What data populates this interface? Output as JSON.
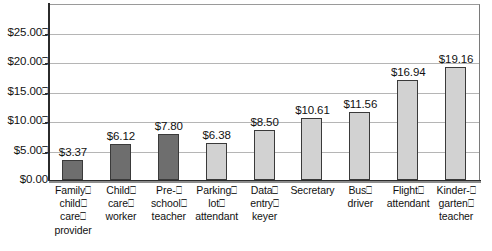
{
  "chart_data": {
    "type": "bar",
    "title": "",
    "subtitle": "",
    "xlabel": "",
    "ylabel": "",
    "ylim": [
      0,
      25
    ],
    "ytick_step": 5,
    "grid": true,
    "legend": "none",
    "value_prefix": "$",
    "categories": [
      "Family child care provider",
      "Child care worker",
      "Pre-school teacher",
      "Parking lot attendant",
      "Data entry keyer",
      "Secretary",
      "Bus driver",
      "Flight attendant",
      "Kindergarten teacher"
    ],
    "values": [
      3.37,
      6.12,
      7.8,
      6.38,
      8.5,
      10.61,
      11.56,
      16.94,
      19.16
    ],
    "value_labels": [
      "$3.37",
      "$6.12",
      "$7.80",
      "$6.38",
      "$8.50",
      "$10.61",
      "$11.56",
      "$16.94",
      "$19.16"
    ],
    "bar_colors": [
      "#6e6e6e",
      "#6e6e6e",
      "#6e6e6e",
      "#d2d2d2",
      "#d2d2d2",
      "#d2d2d2",
      "#d2d2d2",
      "#d2d2d2",
      "#d2d2d2"
    ],
    "series": [
      {
        "name": "Median hourly wage",
        "values": [
          3.37,
          6.12,
          7.8,
          6.38,
          8.5,
          10.61,
          11.56,
          16.94,
          19.16
        ]
      }
    ],
    "yticks": [
      {
        "value": 25,
        "label": "$25.00",
        "trailing_glyph": "⎕"
      },
      {
        "value": 20,
        "label": "$20.00",
        "trailing_glyph": "⎕"
      },
      {
        "value": 15,
        "label": "$15.00",
        "trailing_glyph": "⎕"
      },
      {
        "value": 10,
        "label": "$10.00",
        "trailing_glyph": "⎕"
      },
      {
        "value": 5,
        "label": "$5.00",
        "trailing_glyph": "⎕"
      },
      {
        "value": 0,
        "label": "$0.00",
        "trailing_glyph": ""
      }
    ],
    "category_label_lines": [
      [
        "Family⎕",
        "child⎕",
        "care⎕",
        "provider"
      ],
      [
        "Child⎕",
        "care⎕",
        "worker"
      ],
      [
        "Pre-⎕",
        "school⎕",
        "teacher"
      ],
      [
        "Parking⎕",
        "lot⎕",
        "attendant"
      ],
      [
        "Data⎕",
        "entry⎕",
        "keyer"
      ],
      [
        "Secretary"
      ],
      [
        "Bus⎕",
        "driver"
      ],
      [
        "Flight⎕",
        "attendant"
      ],
      [
        "Kinder-⎕",
        "garten⎕",
        "teacher"
      ]
    ],
    "colors": {
      "bar_dark": "#6e6e6e",
      "bar_light": "#d2d2d2",
      "bar_border": "#3a3a3a",
      "gridline": "#b5b5b5",
      "axis": "#2b2b2b",
      "plot_background": "#ffffff",
      "text": "#111111"
    }
  }
}
